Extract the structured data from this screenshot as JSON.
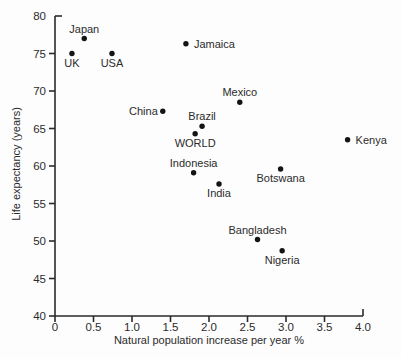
{
  "figure": {
    "background": "#fdfdfd",
    "ink_color": "#2b2b2b",
    "point_color": "#141414"
  },
  "chart_data": {
    "type": "scatter",
    "title": "",
    "xlabel": "Natural population increase per year %",
    "ylabel": "Life expectancy (years)",
    "xlim": [
      0,
      4.0
    ],
    "ylim": [
      40,
      80
    ],
    "grid": false,
    "legend": "none",
    "x_ticks": [
      0,
      0.5,
      1.0,
      1.5,
      2.0,
      2.5,
      3.0,
      3.5,
      4.0
    ],
    "x_tick_labels": [
      "0",
      "0.5",
      "1.0",
      "1.5",
      "2.0",
      "2.5",
      "3.0",
      "3.5",
      "4.0"
    ],
    "y_ticks": [
      40,
      45,
      50,
      55,
      60,
      65,
      70,
      75,
      80
    ],
    "y_tick_labels": [
      "40",
      "45",
      "50",
      "55",
      "60",
      "65",
      "70",
      "75",
      "80"
    ],
    "points": [
      {
        "name": "Japan",
        "x": 0.38,
        "y": 77.0,
        "label_pos": "above"
      },
      {
        "name": "UK",
        "x": 0.22,
        "y": 75.0,
        "label_pos": "below"
      },
      {
        "name": "USA",
        "x": 0.74,
        "y": 75.0,
        "label_pos": "below"
      },
      {
        "name": "Jamaica",
        "x": 1.7,
        "y": 76.3,
        "label_pos": "right"
      },
      {
        "name": "Mexico",
        "x": 2.4,
        "y": 68.5,
        "label_pos": "above"
      },
      {
        "name": "China",
        "x": 1.4,
        "y": 67.3,
        "label_pos": "left"
      },
      {
        "name": "Brazil",
        "x": 1.91,
        "y": 65.3,
        "label_pos": "above"
      },
      {
        "name": "WORLD",
        "x": 1.82,
        "y": 64.3,
        "label_pos": "below"
      },
      {
        "name": "Kenya",
        "x": 3.8,
        "y": 63.5,
        "label_pos": "right"
      },
      {
        "name": "Indonesia",
        "x": 1.8,
        "y": 59.1,
        "label_pos": "above"
      },
      {
        "name": "Botswana",
        "x": 2.93,
        "y": 59.6,
        "label_pos": "below"
      },
      {
        "name": "India",
        "x": 2.13,
        "y": 57.6,
        "label_pos": "below"
      },
      {
        "name": "Bangladesh",
        "x": 2.63,
        "y": 50.2,
        "label_pos": "above"
      },
      {
        "name": "Nigeria",
        "x": 2.95,
        "y": 48.7,
        "label_pos": "below"
      }
    ]
  }
}
